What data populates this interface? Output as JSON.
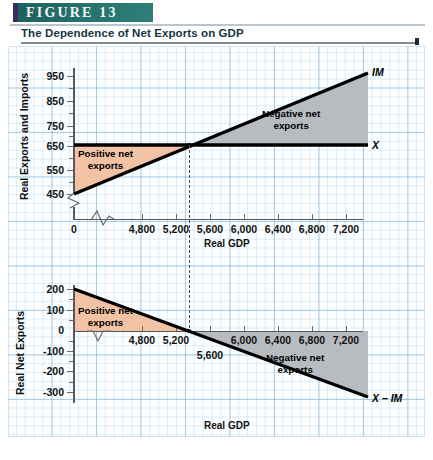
{
  "figure": {
    "banner_label": "FIGURE  13",
    "title": "The Dependence of Net Exports on GDP",
    "accent_color": "#25706c",
    "banner_edge_color": "#3b2a63"
  },
  "chart_data": [
    {
      "id": "top",
      "type": "line",
      "title": "",
      "xlabel": "Real GDP",
      "ylabel": "Real Exports and Imports",
      "xlim": [
        4600,
        7400
      ],
      "ylim": [
        430,
        1000
      ],
      "x_origin_label": "0",
      "xticks": [
        "4,800",
        "5,200",
        "5,600",
        "6,000",
        "6,400",
        "6,800",
        "7,200"
      ],
      "xtick_values": [
        4800,
        5200,
        5600,
        6000,
        6400,
        6800,
        7200
      ],
      "yticks": [
        "450",
        "550",
        "650",
        "750",
        "850",
        "950"
      ],
      "ytick_values": [
        450,
        550,
        650,
        750,
        850,
        950
      ],
      "axis_break": true,
      "grid": true,
      "series": [
        {
          "name": "X",
          "label": "X",
          "points": [
            [
              4600,
              650
            ],
            [
              7400,
              650
            ]
          ],
          "note": "Exports are autonomous, constant at 650"
        },
        {
          "name": "IM",
          "label": "IM",
          "points": [
            [
              4600,
              450
            ],
            [
              7400,
              990
            ]
          ],
          "note": "Imports rise with real GDP"
        }
      ],
      "intersection": {
        "x": 5350,
        "y": 650
      },
      "regions": [
        {
          "label": "Positive net exports",
          "color": "#f2c2a5",
          "side": "left"
        },
        {
          "label": "Negative net exports",
          "color": "#b8bcc0",
          "side": "right"
        }
      ]
    },
    {
      "id": "bottom",
      "type": "line",
      "title": "",
      "xlabel": "Real GDP",
      "ylabel": "Real Net Exports",
      "xlim": [
        4600,
        7400
      ],
      "ylim": [
        -320,
        220
      ],
      "xticks": [
        "4,800",
        "5,200",
        "5,600",
        "6,000",
        "6,400",
        "6,800",
        "7,200"
      ],
      "xtick_values": [
        4800,
        5200,
        5600,
        6000,
        6400,
        6800,
        7200
      ],
      "yticks": [
        "200",
        "100",
        "0",
        "-100",
        "-200",
        "-300"
      ],
      "ytick_values": [
        200,
        100,
        0,
        -100,
        -200,
        -300
      ],
      "axis_break": true,
      "grid": true,
      "series": [
        {
          "name": "X - IM",
          "label": "X – IM",
          "points": [
            [
              4600,
              200
            ],
            [
              7400,
              -340
            ]
          ],
          "note": "Net exports decline as real GDP rises, crossing zero at about 5,350"
        }
      ],
      "intersection": {
        "x": 5350,
        "y": 0
      },
      "regions": [
        {
          "label": "Positive net exports",
          "color": "#f2c2a5",
          "side": "left"
        },
        {
          "label": "Negative net exports",
          "color": "#b8bcc0",
          "side": "right"
        }
      ]
    }
  ],
  "labels": {
    "y_axis_top": "Real Exports and Imports",
    "y_axis_bottom": "Real Net Exports",
    "x_axis": "Real GDP",
    "zero": "0",
    "positive_net_exports": "Positive net\nexports",
    "negative_net_exports": "Negative net\nexports",
    "curve_x": "X",
    "curve_im": "IM",
    "curve_x_minus_im": "X – IM"
  }
}
